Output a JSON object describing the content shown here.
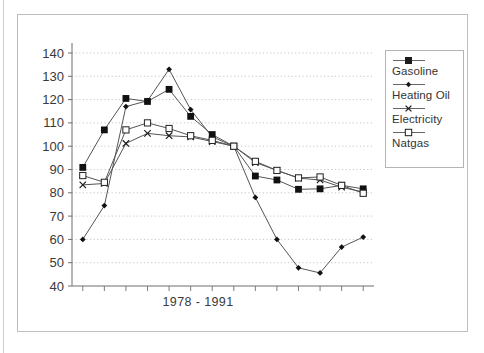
{
  "figure": {
    "top_artifact_text": "",
    "x_axis_title": "1978 - 1991"
  },
  "legend": {
    "entries": [
      {
        "label": "Gasoline",
        "marker": "filled-square-marker"
      },
      {
        "label": "Heating Oil",
        "marker": "small-diamond-marker"
      },
      {
        "label": "Electricity",
        "marker": "x-cross-marker"
      },
      {
        "label": "Natgas",
        "marker": "open-square-marker"
      }
    ]
  },
  "colors": {
    "ink": "#2b2b2b",
    "line": "#555555",
    "grid": "#b9b9b9",
    "axis": "#6e6e6e",
    "frame": "#bdbdbd",
    "background": "#ffffff"
  },
  "chart_data": {
    "type": "line",
    "title": "",
    "xlabel": "1978 - 1991",
    "ylabel": "",
    "ylim": [
      40,
      140
    ],
    "yticks": [
      40,
      50,
      60,
      70,
      80,
      90,
      100,
      110,
      120,
      130,
      140
    ],
    "grid": true,
    "legend_position": "right",
    "x": [
      1978,
      1979,
      1980,
      1981,
      1982,
      1983,
      1984,
      1985,
      1986,
      1987,
      1988,
      1989,
      1990,
      1991
    ],
    "categories": [
      "1978",
      "1979",
      "1980",
      "1981",
      "1982",
      "1983",
      "1984",
      "1985",
      "1986",
      "1987",
      "1988",
      "1989",
      "1990",
      "1991"
    ],
    "series": [
      {
        "name": "Gasoline",
        "marker": "filled-square",
        "values": [
          90.9,
          107.0,
          120.5,
          119.2,
          124.4,
          112.8,
          105.0,
          100.0,
          87.2,
          85.5,
          81.5,
          81.7,
          83.2,
          81.7
        ]
      },
      {
        "name": "Heating Oil",
        "marker": "small-diamond",
        "values": [
          60.0,
          74.5,
          117.0,
          119.5,
          133.0,
          115.7,
          104.0,
          100.0,
          78.0,
          60.0,
          47.8,
          45.6,
          56.7,
          61.0
        ]
      },
      {
        "name": "Electricity",
        "marker": "x-cross",
        "values": [
          83.4,
          84.0,
          101.2,
          105.5,
          104.5,
          104.0,
          102.0,
          100.0,
          93.0,
          89.6,
          86.3,
          85.5,
          82.4,
          80.3
        ]
      },
      {
        "name": "Natgas",
        "marker": "open-square",
        "values": [
          87.4,
          84.5,
          107.0,
          110.0,
          107.6,
          104.5,
          102.5,
          100.0,
          93.5,
          89.6,
          86.4,
          86.8,
          83.2,
          79.8
        ]
      }
    ]
  }
}
